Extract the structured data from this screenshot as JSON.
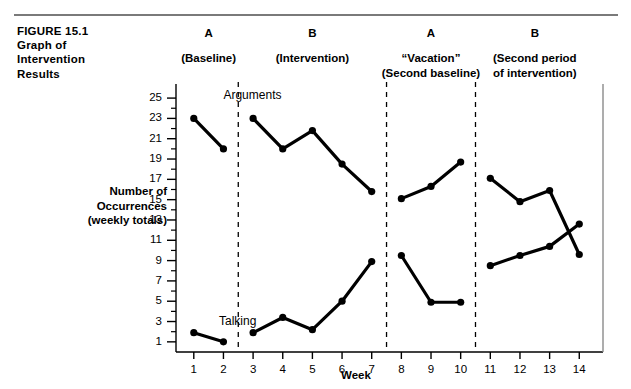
{
  "figure": {
    "caption_lines": [
      "FIGURE 15.1",
      "Graph of",
      "Intervention",
      "Results"
    ]
  },
  "phases": [
    {
      "letter": "A",
      "sub": "(Baseline)",
      "sub2": "",
      "weeks": [
        1,
        2
      ]
    },
    {
      "letter": "B",
      "sub": "(Intervention)",
      "sub2": "",
      "weeks": [
        3,
        4,
        5,
        6,
        7
      ]
    },
    {
      "letter": "A",
      "sub": "“Vacation”",
      "sub2": "(Second baseline)",
      "weeks": [
        8,
        9,
        10
      ]
    },
    {
      "letter": "B",
      "sub": "(Second period",
      "sub2": "of intervention)",
      "weeks": [
        11,
        12,
        13,
        14
      ]
    }
  ],
  "chart_data": {
    "type": "line",
    "title": "Graph of Intervention Results",
    "xlabel": "Week",
    "ylabel": "Number of Occurrences (weekly totals)",
    "ylabel_lines": [
      "Number of",
      "Occurrences",
      "(weekly totals)"
    ],
    "x": [
      1,
      2,
      3,
      4,
      5,
      6,
      7,
      8,
      9,
      10,
      11,
      12,
      13,
      14
    ],
    "xlim": [
      0.4,
      14.8
    ],
    "ylim": [
      0,
      25.6
    ],
    "yticks": [
      1,
      3,
      5,
      7,
      9,
      11,
      13,
      15,
      17,
      19,
      21,
      23,
      25
    ],
    "ytick_labels": [
      "1",
      "3",
      "5",
      "7",
      "9",
      "11",
      "13",
      "15",
      "17",
      "19",
      "21",
      "23",
      "25"
    ],
    "minor_yticks": [
      2,
      4,
      6,
      8,
      10,
      12,
      14,
      16,
      18,
      20,
      22,
      24
    ],
    "xticks": [
      1,
      2,
      3,
      4,
      5,
      6,
      7,
      8,
      9,
      10,
      11,
      12,
      13,
      14
    ],
    "xtick_labels": [
      "1",
      "2",
      "3",
      "4",
      "5",
      "6",
      "7",
      "8",
      "9",
      "10",
      "11",
      "12",
      "13",
      "14"
    ],
    "grid": false,
    "legend": "inline-labels",
    "phase_dividers": [
      2.5,
      7.5,
      10.5
    ],
    "series": [
      {
        "name": "Arguments",
        "label_x": 2.0,
        "label_y": 25.2,
        "color": "#000000",
        "segments": [
          {
            "phase": "A",
            "x": [
              1,
              2
            ],
            "values": [
              23,
              20
            ]
          },
          {
            "phase": "B",
            "x": [
              3,
              4,
              5,
              6,
              7
            ],
            "values": [
              23,
              20,
              21.8,
              18.5,
              15.8
            ]
          },
          {
            "phase": "A2",
            "x": [
              8,
              9,
              10
            ],
            "values": [
              15.1,
              16.3,
              18.7
            ]
          },
          {
            "phase": "B2",
            "x": [
              11,
              12,
              13,
              14
            ],
            "values": [
              17.1,
              14.8,
              15.9,
              9.6
            ]
          }
        ]
      },
      {
        "name": "Talking",
        "label_x": 1.85,
        "label_y": 3.0,
        "color": "#000000",
        "segments": [
          {
            "phase": "A",
            "x": [
              1,
              2
            ],
            "values": [
              1.9,
              1.0
            ]
          },
          {
            "phase": "B",
            "x": [
              3,
              4,
              5,
              6,
              7
            ],
            "values": [
              1.9,
              3.4,
              2.2,
              5.0,
              8.9
            ]
          },
          {
            "phase": "A2",
            "x": [
              8,
              9,
              10
            ],
            "values": [
              9.5,
              4.9,
              4.9
            ]
          },
          {
            "phase": "B2",
            "x": [
              11,
              12,
              13,
              14
            ],
            "values": [
              8.5,
              9.5,
              10.4,
              12.6
            ]
          }
        ]
      }
    ]
  }
}
